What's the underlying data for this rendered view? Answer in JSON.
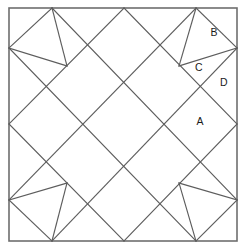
{
  "figure": {
    "type": "line-diagram",
    "background_color": "#ffffff",
    "line_color": "#5d5d5d",
    "border_color": "#6e6e6e",
    "label_color": "#1a1a1a",
    "canvas": {
      "width": 245,
      "height": 251
    }
  },
  "border": {
    "name": "outer-square",
    "x": 9,
    "y": 8,
    "width": 228,
    "height": 233
  },
  "diagonal_grid": {
    "description": "Diagonal lattice of rotated squares inscribed in the outer square",
    "lines": [
      {
        "id": "d1",
        "x1": 52,
        "y1": 8,
        "x2": 9,
        "y2": 48
      },
      {
        "id": "d2",
        "x1": 124,
        "y1": 8,
        "x2": 9,
        "y2": 124
      },
      {
        "id": "d3",
        "x1": 196,
        "y1": 8,
        "x2": 9,
        "y2": 200
      },
      {
        "id": "d4",
        "x1": 237,
        "y1": 48,
        "x2": 52,
        "y2": 241
      },
      {
        "id": "d5",
        "x1": 237,
        "y1": 124,
        "x2": 124,
        "y2": 241
      },
      {
        "id": "d6",
        "x1": 237,
        "y1": 200,
        "x2": 196,
        "y2": 241
      },
      {
        "id": "a1",
        "x1": 52,
        "y1": 8,
        "x2": 237,
        "y2": 200
      },
      {
        "id": "a2",
        "x1": 124,
        "y1": 8,
        "x2": 237,
        "y2": 124
      },
      {
        "id": "a3",
        "x1": 196,
        "y1": 8,
        "x2": 237,
        "y2": 48
      },
      {
        "id": "a4",
        "x1": 9,
        "y1": 48,
        "x2": 196,
        "y2": 241
      },
      {
        "id": "a5",
        "x1": 9,
        "y1": 124,
        "x2": 124,
        "y2": 241
      },
      {
        "id": "a6",
        "x1": 9,
        "y1": 200,
        "x2": 52,
        "y2": 241
      }
    ]
  },
  "corner_spikes": {
    "description": "Four corner spike motifs, each two triangles meeting at an inner lattice node",
    "top_left": {
      "apex_x": 67,
      "apex_y": 66,
      "edge_point_top_x": 52,
      "edge_point_top_y": 8,
      "edge_point_left_x": 9,
      "edge_point_left_y": 48
    },
    "top_right": {
      "apex_x": 179,
      "apex_y": 66,
      "edge_point_top_x": 196,
      "edge_point_top_y": 8,
      "edge_point_right_x": 237,
      "edge_point_right_y": 48
    },
    "bottom_left": {
      "apex_x": 67,
      "apex_y": 183,
      "edge_point_bottom_x": 52,
      "edge_point_bottom_y": 241,
      "edge_point_left_x": 9,
      "edge_point_left_y": 200
    },
    "bottom_right": {
      "apex_x": 179,
      "apex_y": 183,
      "edge_point_bottom_x": 196,
      "edge_point_bottom_y": 241,
      "edge_point_right_x": 237,
      "edge_point_right_y": 200
    }
  },
  "labels": [
    {
      "id": "label-b",
      "text": "B",
      "x": 214,
      "y": 33
    },
    {
      "id": "label-c",
      "text": "C",
      "x": 199,
      "y": 68
    },
    {
      "id": "label-d",
      "text": "D",
      "x": 224,
      "y": 83
    },
    {
      "id": "label-a",
      "text": "A",
      "x": 200,
      "y": 122
    }
  ]
}
